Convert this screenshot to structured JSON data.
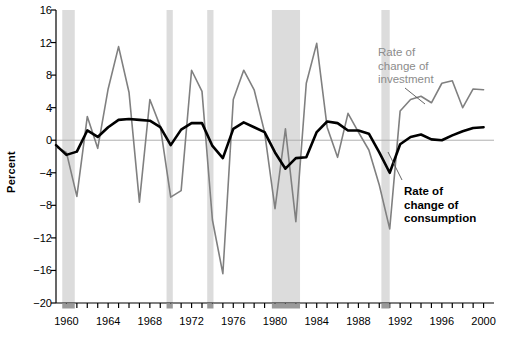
{
  "chart_data": {
    "type": "line",
    "title": "",
    "xlabel": "",
    "ylabel": "Percent",
    "ylim": [
      -20,
      16
    ],
    "xlim": [
      1959,
      2001
    ],
    "yticks": [
      16,
      12,
      8,
      4,
      0,
      -4,
      -8,
      -12,
      -16,
      -20
    ],
    "ytick_labels": [
      "16",
      "12",
      "8",
      "4",
      "0",
      "−4",
      "−8",
      "−12",
      "−16",
      "−20"
    ],
    "xticks": [
      1960,
      1964,
      1968,
      1972,
      1976,
      1980,
      1984,
      1988,
      1992,
      1996,
      2000
    ],
    "xtick_labels": [
      "1960",
      "1964",
      "1968",
      "1972",
      "1976",
      "1980",
      "1984",
      "1988",
      "1992",
      "1996",
      "2000"
    ],
    "x": [
      1959,
      1960,
      1961,
      1962,
      1963,
      1964,
      1965,
      1966,
      1967,
      1968,
      1969,
      1970,
      1971,
      1972,
      1973,
      1974,
      1975,
      1976,
      1977,
      1978,
      1979,
      1980,
      1981,
      1982,
      1983,
      1984,
      1985,
      1986,
      1987,
      1988,
      1989,
      1990,
      1991,
      1992,
      1993,
      1994,
      1995,
      1996,
      1997,
      1998,
      1999,
      2000
    ],
    "grid": false,
    "legend_position": "inside-right",
    "series": [
      {
        "name": "Rate of change of investment",
        "color": "#808080",
        "width": 1.6,
        "values": [
          -0.8,
          -1.5,
          -6.9,
          2.9,
          -1.0,
          6.3,
          11.5,
          5.9,
          -7.6,
          5.0,
          1.7,
          -7.0,
          -6.2,
          8.6,
          6.0,
          -9.8,
          -16.4,
          5.0,
          8.6,
          6.2,
          1.0,
          -8.4,
          1.4,
          -10.0,
          7.0,
          11.9,
          1.6,
          -2.1,
          3.3,
          1.0,
          -1.2,
          -5.5,
          -10.9,
          3.6,
          5.0,
          5.4,
          4.6,
          7.0,
          7.3,
          4.0,
          6.3,
          6.2
        ]
      },
      {
        "name": "Rate of change of consumption",
        "color": "#000000",
        "width": 2.6,
        "values": [
          -0.6,
          -1.8,
          -1.4,
          1.2,
          0.4,
          1.6,
          2.5,
          2.6,
          2.5,
          2.4,
          1.6,
          -0.6,
          1.3,
          2.1,
          2.1,
          -0.7,
          -2.2,
          1.4,
          2.2,
          1.6,
          1.0,
          -1.5,
          -3.5,
          -2.2,
          -2.1,
          1.0,
          2.3,
          2.1,
          1.2,
          1.2,
          0.8,
          -1.5,
          -4.0,
          -0.5,
          0.4,
          0.7,
          0.1,
          0.0,
          0.6,
          1.1,
          1.5,
          1.6
        ]
      }
    ],
    "recession_bands": [
      {
        "start": 1959.6,
        "end": 1960.8
      },
      {
        "start": 1969.6,
        "end": 1970.2
      },
      {
        "start": 1973.5,
        "end": 1974.1
      },
      {
        "start": 1979.7,
        "end": 1982.4
      },
      {
        "start": 1990.2,
        "end": 1991.0
      }
    ],
    "band_color": "#dcdcdc",
    "axis_color": "#000000",
    "zero_line_color": "#b0b0b0",
    "annotations": [
      {
        "name": "investment-label",
        "text": "Rate of\nchange of\ninvestment",
        "x": 378,
        "y": 46,
        "color": "#8c8c8c",
        "bold": false
      },
      {
        "name": "consumption-label",
        "text": "Rate of\nchange of\nconsumption",
        "x": 404,
        "y": 185,
        "color": "#000000",
        "bold": true
      }
    ],
    "leader_lines": [
      {
        "name": "investment-leader",
        "x1": 405,
        "y1": 88,
        "x2": 425,
        "y2": 104
      },
      {
        "name": "consumption-leader",
        "x1": 402,
        "y1": 180,
        "x2": 388,
        "y2": 152
      }
    ]
  }
}
